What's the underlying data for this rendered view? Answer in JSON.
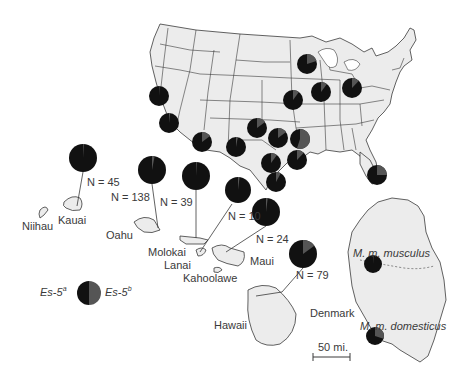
{
  "colors": {
    "es5a": "#111111",
    "es5b": "#555555",
    "land": "#ececec",
    "border": "#3a3a3a",
    "text": "#3a3a3a"
  },
  "legend": {
    "es5a_base": "Es-5",
    "es5a_sup": "a",
    "es5b_base": "Es-5",
    "es5b_sup": "b"
  },
  "islands": [
    {
      "name": "Niihau"
    },
    {
      "name": "Kauai"
    },
    {
      "name": "Oahu"
    },
    {
      "name": "Molokai"
    },
    {
      "name": "Lanai"
    },
    {
      "name": "Kahoolawe"
    },
    {
      "name": "Maui"
    },
    {
      "name": "Hawaii"
    }
  ],
  "denmark": {
    "name": "Denmark",
    "north_label": "M. m. musculus",
    "south_label": "M. m. domesticus"
  },
  "scale_bar": "50 mi.",
  "sample_sizes": [
    {
      "label": "N = 45"
    },
    {
      "label": "N = 138"
    },
    {
      "label": "N = 39"
    },
    {
      "label": "N = 10"
    },
    {
      "label": "N = 24"
    },
    {
      "label": "N = 79"
    }
  ],
  "chart_data": {
    "type": "pie",
    "title": "",
    "legend": [
      "Es-5a",
      "Es-5b"
    ],
    "pies": [
      {
        "region": "Hawaii",
        "site": "Kauai",
        "n": 45,
        "es5a": 0.99,
        "es5b": 0.01
      },
      {
        "region": "Hawaii",
        "site": "Oahu",
        "n": 138,
        "es5a": 0.97,
        "es5b": 0.03
      },
      {
        "region": "Hawaii",
        "site": "Molokai",
        "n": 39,
        "es5a": 0.99,
        "es5b": 0.01
      },
      {
        "region": "Hawaii",
        "site": "Lanai",
        "n": 10,
        "es5a": 0.98,
        "es5b": 0.02
      },
      {
        "region": "Hawaii",
        "site": "Maui",
        "n": 24,
        "es5a": 0.98,
        "es5b": 0.02
      },
      {
        "region": "Hawaii",
        "site": "Hawaii",
        "n": 79,
        "es5a": 0.85,
        "es5b": 0.15
      },
      {
        "region": "USA",
        "site": "Northern California",
        "es5a": 0.99,
        "es5b": 0.01
      },
      {
        "region": "USA",
        "site": "Southern California",
        "es5a": 0.98,
        "es5b": 0.02
      },
      {
        "region": "USA",
        "site": "Arizona",
        "es5a": 0.85,
        "es5b": 0.15
      },
      {
        "region": "USA",
        "site": "West Texas",
        "es5a": 0.97,
        "es5b": 0.03
      },
      {
        "region": "USA",
        "site": "Oklahoma",
        "es5a": 0.85,
        "es5b": 0.15
      },
      {
        "region": "USA",
        "site": "NE Texas",
        "es5a": 0.85,
        "es5b": 0.15
      },
      {
        "region": "USA",
        "site": "Arkansas",
        "es5a": 0.45,
        "es5b": 0.55
      },
      {
        "region": "USA",
        "site": "Central Texas",
        "es5a": 0.9,
        "es5b": 0.1
      },
      {
        "region": "USA",
        "site": "East Texas",
        "es5a": 0.88,
        "es5b": 0.12
      },
      {
        "region": "USA",
        "site": "South Texas",
        "es5a": 0.92,
        "es5b": 0.08
      },
      {
        "region": "USA",
        "site": "Missouri",
        "es5a": 0.9,
        "es5b": 0.1
      },
      {
        "region": "USA",
        "site": "Wisconsin",
        "es5a": 0.8,
        "es5b": 0.2
      },
      {
        "region": "USA",
        "site": "Illinois",
        "es5a": 0.9,
        "es5b": 0.1
      },
      {
        "region": "USA",
        "site": "Ohio",
        "es5a": 0.88,
        "es5b": 0.12
      },
      {
        "region": "USA",
        "site": "Florida",
        "es5a": 0.75,
        "es5b": 0.25
      },
      {
        "region": "Denmark",
        "site": "M. m. musculus",
        "es5a": 0.99,
        "es5b": 0.01
      },
      {
        "region": "Denmark",
        "site": "M. m. domesticus",
        "es5a": 0.7,
        "es5b": 0.3
      }
    ]
  }
}
